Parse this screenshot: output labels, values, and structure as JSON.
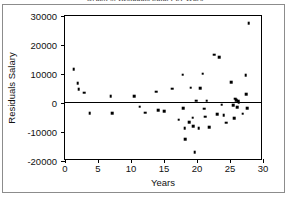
{
  "chart_data": {
    "type": "scatter",
    "title": "Graph of Residuals Salary by Years",
    "xlabel": "Years",
    "ylabel": "Residuals Salary",
    "xlim": [
      0,
      30
    ],
    "ylim": [
      -20000,
      30000
    ],
    "xticks": [
      0,
      5,
      10,
      15,
      20,
      25,
      30
    ],
    "xtick_labels": [
      "0",
      "5",
      "10",
      "15",
      "20",
      "25",
      "30"
    ],
    "yticks": [
      -20000,
      -10000,
      0,
      10000,
      20000,
      30000
    ],
    "ytick_labels": [
      "-20000",
      "-10000",
      "0",
      "10000",
      "20000",
      "30000"
    ],
    "grid": false,
    "legend": false,
    "reference_line": {
      "orientation": "horizontal",
      "y": 0,
      "color": "#000000"
    },
    "marker_color": "#000000",
    "marker_size": 2.6,
    "points": [
      {
        "x": 1.5,
        "y": 11300
      },
      {
        "x": 2.1,
        "y": 6400
      },
      {
        "x": 2.2,
        "y": 4500
      },
      {
        "x": 3.1,
        "y": 3200
      },
      {
        "x": 3.9,
        "y": -3800
      },
      {
        "x": 7.1,
        "y": 1900
      },
      {
        "x": 7.3,
        "y": -3900
      },
      {
        "x": 10.6,
        "y": 2100
      },
      {
        "x": 11.5,
        "y": -1600
      },
      {
        "x": 12.3,
        "y": -3700
      },
      {
        "x": 14.0,
        "y": 3600
      },
      {
        "x": 14.3,
        "y": -2800
      },
      {
        "x": 15.2,
        "y": -3100
      },
      {
        "x": 16.4,
        "y": 4600
      },
      {
        "x": 17.4,
        "y": -6100
      },
      {
        "x": 18.0,
        "y": 9400
      },
      {
        "x": 18.1,
        "y": -2200
      },
      {
        "x": 18.3,
        "y": -9100
      },
      {
        "x": 18.4,
        "y": -12900
      },
      {
        "x": 19.0,
        "y": -7000
      },
      {
        "x": 19.2,
        "y": 4900
      },
      {
        "x": 19.5,
        "y": -5400
      },
      {
        "x": 19.6,
        "y": -8400
      },
      {
        "x": 19.8,
        "y": -17300
      },
      {
        "x": 20.0,
        "y": 500
      },
      {
        "x": 20.4,
        "y": -9100
      },
      {
        "x": 20.6,
        "y": 4700
      },
      {
        "x": 21.0,
        "y": 9700
      },
      {
        "x": 21.2,
        "y": -2300
      },
      {
        "x": 21.4,
        "y": -5100
      },
      {
        "x": 21.6,
        "y": 400
      },
      {
        "x": 22.0,
        "y": -8700
      },
      {
        "x": 22.8,
        "y": 16300
      },
      {
        "x": 23.2,
        "y": -4200
      },
      {
        "x": 23.5,
        "y": 15400
      },
      {
        "x": 23.9,
        "y": -1000
      },
      {
        "x": 24.2,
        "y": -4600
      },
      {
        "x": 24.6,
        "y": -7200
      },
      {
        "x": 25.3,
        "y": 6900
      },
      {
        "x": 25.6,
        "y": -1200
      },
      {
        "x": 25.8,
        "y": -5500
      },
      {
        "x": 25.9,
        "y": 1200
      },
      {
        "x": 26.1,
        "y": 700
      },
      {
        "x": 26.2,
        "y": -1800
      },
      {
        "x": 26.4,
        "y": 200
      },
      {
        "x": 26.5,
        "y": -300
      },
      {
        "x": 27.1,
        "y": -4100
      },
      {
        "x": 27.5,
        "y": 9200
      },
      {
        "x": 27.6,
        "y": 2700
      },
      {
        "x": 27.8,
        "y": -2100
      },
      {
        "x": 28.0,
        "y": 27200
      }
    ]
  }
}
